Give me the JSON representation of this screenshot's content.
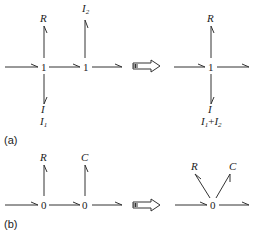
{
  "panel_a": {
    "caption": "(a)",
    "left": {
      "junction1": "1",
      "junction2": "1",
      "label_R": "R",
      "label_I2_main": "I",
      "label_I2_sub": "2",
      "label_I_down": "I",
      "label_I1_main": "I",
      "label_I1_sub": "1"
    },
    "right": {
      "junction": "1",
      "label_R": "R",
      "label_I_down": "I",
      "label_sum_main1": "I",
      "label_sum_sub1": "1",
      "label_sum_plus": "+",
      "label_sum_main2": "I",
      "label_sum_sub2": "2"
    }
  },
  "panel_b": {
    "caption": "(b)",
    "left": {
      "junction1": "0",
      "junction2": "0",
      "label_R": "R",
      "label_C": "C"
    },
    "right": {
      "junction": "0",
      "label_R": "R",
      "label_C": "C"
    }
  },
  "colors": {
    "stroke": "#333333",
    "text": "#222222",
    "background": "#ffffff"
  }
}
